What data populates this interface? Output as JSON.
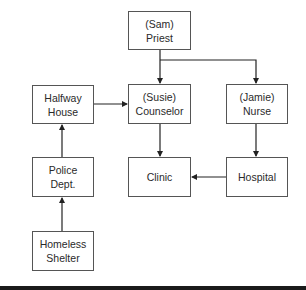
{
  "diagram": {
    "type": "flowchart",
    "nodes": [
      {
        "id": "priest",
        "line1": "(Sam)",
        "line2": "Priest",
        "x": 128,
        "y": 11,
        "w": 63,
        "h": 39
      },
      {
        "id": "halfway",
        "line1": "Halfway",
        "line2": "House",
        "x": 32,
        "y": 85,
        "w": 62,
        "h": 39
      },
      {
        "id": "counselor",
        "line1": "(Susie)",
        "line2": "Counselor",
        "x": 128,
        "y": 84,
        "w": 63,
        "h": 40
      },
      {
        "id": "nurse",
        "line1": "(Jamie)",
        "line2": "Nurse",
        "x": 226,
        "y": 84,
        "w": 62,
        "h": 40
      },
      {
        "id": "police",
        "line1": "Police",
        "line2": "Dept.",
        "x": 32,
        "y": 157,
        "w": 62,
        "h": 40
      },
      {
        "id": "clinic",
        "line1": "Clinic",
        "line2": "",
        "x": 128,
        "y": 157,
        "w": 63,
        "h": 40
      },
      {
        "id": "hospital",
        "line1": "Hospital",
        "line2": "",
        "x": 226,
        "y": 157,
        "w": 62,
        "h": 40
      },
      {
        "id": "shelter",
        "line1": "Homeless",
        "line2": "Shelter",
        "x": 32,
        "y": 231,
        "w": 62,
        "h": 40
      }
    ],
    "edges": [
      {
        "from": "priest",
        "to": "counselor"
      },
      {
        "from": "priest",
        "to": "nurse"
      },
      {
        "from": "halfway",
        "to": "counselor"
      },
      {
        "from": "counselor",
        "to": "clinic"
      },
      {
        "from": "nurse",
        "to": "hospital"
      },
      {
        "from": "hospital",
        "to": "clinic"
      },
      {
        "from": "police",
        "to": "halfway"
      },
      {
        "from": "shelter",
        "to": "police"
      }
    ],
    "colors": {
      "line": "#222222",
      "border": "#555555",
      "text": "#2a2a2a"
    }
  }
}
